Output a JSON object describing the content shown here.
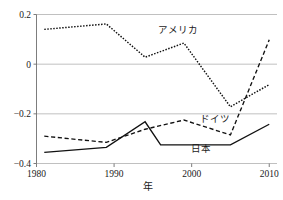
{
  "chart_data": {
    "type": "line",
    "title": "",
    "subtitle": "",
    "xlabel": "年",
    "ylabel": "",
    "xlim": [
      1980,
      2011
    ],
    "ylim": [
      -0.4,
      0.2
    ],
    "xticks": [
      1980,
      1990,
      2000,
      2010
    ],
    "xtick_labels": [
      "1980",
      "1990",
      "2000",
      "2010"
    ],
    "yticks": [
      -0.4,
      -0.2,
      0,
      0.2
    ],
    "ytick_labels": [
      "-0.4",
      "-0.2",
      "0",
      "0.2"
    ],
    "grid": "horizontal",
    "legend_position": "inline-annotations",
    "series": [
      {
        "name": "アメリカ",
        "style": "dotted",
        "label_x": 1998.2,
        "label_y": 0.125,
        "x": [
          1981,
          1989,
          1994,
          1999,
          2005,
          2010
        ],
        "values": [
          0.14,
          0.162,
          0.028,
          0.085,
          -0.172,
          -0.082
        ]
      },
      {
        "name": "ドイツ",
        "style": "dashed",
        "label_x": 2003.0,
        "label_y": -0.232,
        "x": [
          1981,
          1989,
          1994,
          1999,
          2005,
          2010
        ],
        "values": [
          -0.29,
          -0.315,
          -0.262,
          -0.225,
          -0.285,
          0.098
        ]
      },
      {
        "name": "日本",
        "style": "solid",
        "label_x": 2001.2,
        "label_y": -0.352,
        "x": [
          1981,
          1989,
          1994,
          1996,
          2005,
          2010
        ],
        "values": [
          -0.355,
          -0.335,
          -0.232,
          -0.325,
          -0.325,
          -0.242
        ]
      }
    ]
  },
  "axis": {
    "x_title": "年"
  }
}
